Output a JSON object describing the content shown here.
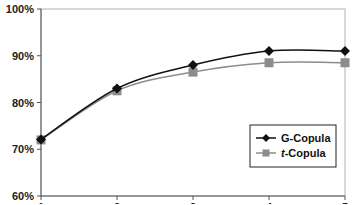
{
  "chart_data": {
    "type": "line",
    "title": "",
    "xlabel": "",
    "ylabel": "",
    "x": [
      1,
      2,
      3,
      4,
      5
    ],
    "x_tick_labels": [
      "1",
      "2",
      "3",
      "4",
      "5"
    ],
    "y_tick_labels": [
      "60%",
      "70%",
      "80%",
      "90%",
      "100%"
    ],
    "ylim": [
      60,
      100
    ],
    "grid": false,
    "legend_position": "lower right",
    "smoothed": true,
    "series": [
      {
        "name": "G-Copula",
        "name_prefix": "G",
        "name_suffix": "-Copula",
        "italic_prefix": false,
        "marker": "diamond",
        "color": "#111111",
        "values": [
          72.1,
          83.0,
          88.0,
          91.0,
          91.0
        ]
      },
      {
        "name": "t-Copula",
        "name_prefix": "t",
        "name_suffix": "-Copula",
        "italic_prefix": true,
        "marker": "square",
        "color": "#8c8c8c",
        "values": [
          72.0,
          82.5,
          86.5,
          88.5,
          88.5
        ]
      }
    ]
  }
}
